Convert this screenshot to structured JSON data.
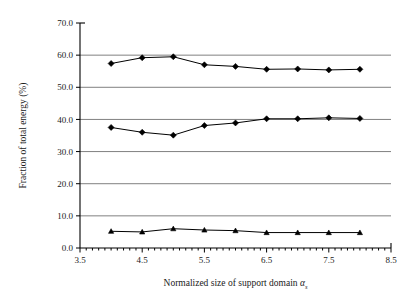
{
  "chart_data": {
    "type": "line",
    "title": "",
    "xlabel": "Normalized size of support domain α",
    "xlabel_subscript": "s",
    "ylabel": "Fraction of total energy (%)",
    "xlim": [
      3.5,
      8.5
    ],
    "ylim": [
      0.0,
      70.0
    ],
    "grid": true,
    "grid_axis": "y",
    "legend_position": "none",
    "x_tick_labels": [
      "3.5",
      "4.5",
      "5.5",
      "6.5",
      "7.5",
      "8.5"
    ],
    "x_tick_values": [
      3.5,
      4.5,
      5.5,
      6.5,
      7.5,
      8.5
    ],
    "x_minor_tick_step": 0.1,
    "y_tick_labels": [
      "0.0",
      "10.0",
      "20.0",
      "30.0",
      "40.0",
      "50.0",
      "60.0",
      "70.0"
    ],
    "y_tick_values": [
      0.0,
      10.0,
      20.0,
      30.0,
      40.0,
      50.0,
      60.0,
      70.0
    ],
    "x": [
      4.0,
      4.5,
      5.0,
      5.5,
      6.0,
      6.5,
      7.0,
      7.5,
      8.0
    ],
    "series": [
      {
        "name": "upper",
        "marker": "diamond",
        "color": "#000000",
        "values": [
          57.4,
          59.2,
          59.5,
          57.0,
          56.5,
          55.6,
          55.7,
          55.4,
          55.6
        ]
      },
      {
        "name": "middle",
        "marker": "diamond",
        "color": "#000000",
        "values": [
          37.5,
          36.0,
          35.1,
          38.1,
          38.9,
          40.2,
          40.2,
          40.5,
          40.3
        ]
      },
      {
        "name": "lower",
        "marker": "triangle",
        "color": "#000000",
        "values": [
          5.2,
          5.0,
          6.0,
          5.6,
          5.4,
          4.8,
          4.8,
          4.8,
          4.8
        ]
      }
    ]
  },
  "style": {
    "grid_color": "#808080",
    "axis_color": "#000000",
    "line_color": "#000000",
    "marker_color": "#000000",
    "background": "#ffffff"
  },
  "geometry": {
    "plot_left": 80,
    "plot_right": 391,
    "plot_top": 23,
    "plot_bottom": 248
  }
}
